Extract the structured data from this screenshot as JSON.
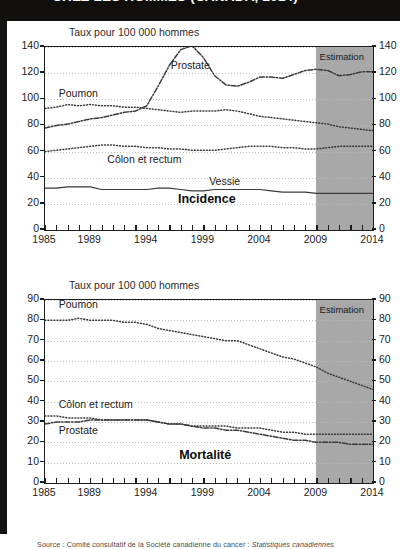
{
  "header": {
    "title_partial": "CHEZ LES HOMMES (CANADA, 2014)",
    "band_color": "#100f0d"
  },
  "source": {
    "prefix": "Source : Comité consultatif de la Société canadienne du cancer :",
    "italic": "Statistiques canadiennes"
  },
  "colors": {
    "estimation_band": "#a8a8a8",
    "frame": "#1c1c1c",
    "grid": "#b9b9b9",
    "line": "#3a3a3a"
  },
  "chart_data": [
    {
      "type": "line",
      "id": "incidence",
      "title": "Incidence",
      "ylabel": "Taux pour 100 000 hommes",
      "xlabel": "",
      "ylim": [
        0,
        140
      ],
      "yticks": [
        0,
        20,
        40,
        60,
        80,
        100,
        120,
        140
      ],
      "xlim": [
        1985,
        2014
      ],
      "xticks": [
        1985,
        1989,
        1994,
        1999,
        2004,
        2009,
        2014
      ],
      "grid": true,
      "legend_position": "inline-annotations",
      "annotations": [
        {
          "text": "Estimation",
          "x": 2011.4,
          "y": 131
        },
        {
          "text": "Incidence",
          "x": 1999.5,
          "y": 23
        }
      ],
      "estimation_from": 2009,
      "x": [
        1985,
        1986,
        1987,
        1988,
        1989,
        1990,
        1991,
        1992,
        1993,
        1994,
        1995,
        1996,
        1997,
        1998,
        1999,
        2000,
        2001,
        2002,
        2003,
        2004,
        2005,
        2006,
        2007,
        2008,
        2009,
        2010,
        2011,
        2012,
        2013,
        2014
      ],
      "series": [
        {
          "name": "Prostate",
          "style": "dash-dot",
          "label_x": 1996.2,
          "label_y": 125,
          "values": [
            78,
            80,
            81,
            83,
            85,
            86,
            88,
            90,
            91,
            95,
            110,
            126,
            138,
            141,
            132,
            118,
            111,
            110,
            113,
            117,
            117,
            116,
            119,
            122,
            123,
            122,
            118,
            119,
            121,
            121
          ]
        },
        {
          "name": "Poumon",
          "style": "dotted",
          "label_x": 1986.3,
          "label_y": 103,
          "values": [
            93,
            94,
            96,
            95,
            96,
            95,
            95,
            94,
            94,
            93,
            92,
            91,
            90,
            91,
            91,
            91,
            92,
            91,
            89,
            87,
            86,
            85,
            84,
            83,
            82,
            81,
            79,
            78,
            77,
            76
          ]
        },
        {
          "name": "Côlon et rectum",
          "style": "dotted",
          "label_x": 1990.6,
          "label_y": 53,
          "values": [
            60,
            61,
            62,
            63,
            64,
            65,
            65,
            64,
            64,
            63,
            63,
            62,
            62,
            61,
            61,
            61,
            62,
            63,
            64,
            64,
            64,
            63,
            63,
            62,
            62,
            63,
            64,
            64,
            64,
            64
          ]
        },
        {
          "name": "Vessie",
          "style": "solid",
          "label_x": 1999.6,
          "label_y": 36,
          "values": [
            32,
            32,
            33,
            33,
            33,
            31,
            31,
            31,
            31,
            31,
            32,
            32,
            31,
            30,
            30,
            31,
            31,
            31,
            31,
            31,
            30,
            29,
            29,
            29,
            28,
            28,
            28,
            28,
            28,
            28
          ]
        }
      ]
    },
    {
      "type": "line",
      "id": "mortalite",
      "title": "Mortalité",
      "ylabel": "Taux pour 100 000 hommes",
      "xlabel": "",
      "ylim": [
        0,
        90
      ],
      "yticks": [
        0,
        10,
        20,
        30,
        40,
        50,
        60,
        70,
        80,
        90
      ],
      "xlim": [
        1985,
        2014
      ],
      "xticks": [
        1985,
        1989,
        1994,
        1999,
        2004,
        2009,
        2014
      ],
      "grid": true,
      "legend_position": "inline-annotations",
      "annotations": [
        {
          "text": "Estimation",
          "x": 2011.4,
          "y": 84
        },
        {
          "text": "Mortalité",
          "x": 1999.6,
          "y": 13.5
        }
      ],
      "estimation_from": 2009,
      "x": [
        1985,
        1986,
        1987,
        1988,
        1989,
        1990,
        1991,
        1992,
        1993,
        1994,
        1995,
        1996,
        1997,
        1998,
        1999,
        2000,
        2001,
        2002,
        2003,
        2004,
        2005,
        2006,
        2007,
        2008,
        2009,
        2010,
        2011,
        2012,
        2013,
        2014
      ],
      "series": [
        {
          "name": "Poumon",
          "style": "dotted",
          "label_x": 1986.3,
          "label_y": 87,
          "values": [
            80,
            80,
            80,
            81,
            80,
            80,
            80,
            79,
            79,
            78,
            76,
            75,
            74,
            73,
            72,
            71,
            70,
            70,
            68,
            66,
            64,
            62,
            61,
            59,
            57,
            54,
            52,
            50,
            48,
            46
          ]
        },
        {
          "name": "Côlon et rectum",
          "style": "dotted",
          "label_x": 1986.3,
          "label_y": 38,
          "values": [
            33,
            33,
            32,
            32,
            32,
            31,
            31,
            31,
            31,
            31,
            30,
            29,
            29,
            28,
            28,
            28,
            28,
            27,
            27,
            27,
            26,
            25,
            25,
            24,
            24,
            24,
            24,
            24,
            24,
            24
          ]
        },
        {
          "name": "Prostate",
          "style": "dash-dot",
          "label_x": 1986.3,
          "label_y": 25,
          "values": [
            29,
            30,
            30,
            30,
            31,
            31,
            31,
            31,
            31,
            31,
            30,
            29,
            29,
            28,
            27,
            27,
            26,
            26,
            25,
            24,
            23,
            22,
            21,
            21,
            20,
            20,
            20,
            19,
            19,
            19
          ]
        }
      ]
    }
  ]
}
